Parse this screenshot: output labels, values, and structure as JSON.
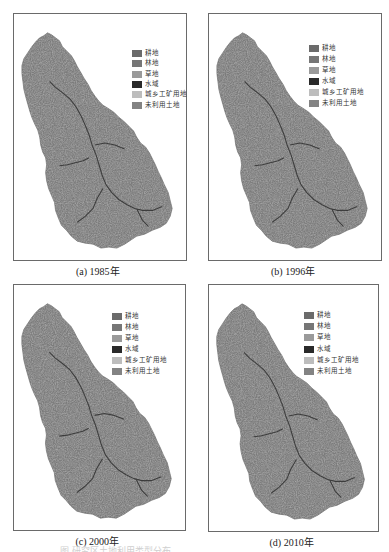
{
  "figure": {
    "panels": [
      {
        "id": "a",
        "caption": "(a) 1985年",
        "frame": {
          "x": 13,
          "y": 13,
          "w": 174,
          "h": 248
        },
        "legend_pos": {
          "x": 131,
          "y": 48
        },
        "legend_step": 10.3
      },
      {
        "id": "b",
        "caption": "(b) 1996年",
        "frame": {
          "x": 208,
          "y": 13,
          "w": 174,
          "h": 248
        },
        "legend_pos": {
          "x": 308,
          "y": 43
        },
        "legend_step": 11
      },
      {
        "id": "c",
        "caption": "(c) 2000年",
        "frame": {
          "x": 13,
          "y": 284,
          "w": 173,
          "h": 247
        },
        "legend_pos": {
          "x": 111,
          "y": 311
        },
        "legend_step": 11
      },
      {
        "id": "d",
        "caption": "(d) 2010年",
        "frame": {
          "x": 208,
          "y": 284,
          "w": 171,
          "h": 248
        },
        "legend_pos": {
          "x": 303,
          "y": 310
        },
        "legend_step": 11.2
      }
    ],
    "legend": {
      "items": [
        {
          "label": "耕地",
          "color": "#6b6b6b"
        },
        {
          "label": "林地",
          "color": "#767676"
        },
        {
          "label": "草地",
          "color": "#9a9a9a"
        },
        {
          "label": "水域",
          "color": "#2a2a2a"
        },
        {
          "label": "城乡工矿用地",
          "color": "#bdbdbd"
        },
        {
          "label": "未利用土地",
          "color": "#838383"
        }
      ]
    },
    "map_colors": {
      "base": "#7b7b7b",
      "dark": "#5e5e5e",
      "river": "#2f2f2f"
    },
    "bottom_caption_partial": "图  研究区土地利用类型分布"
  }
}
